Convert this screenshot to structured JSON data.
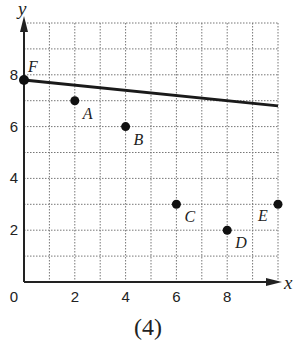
{
  "chart_data": {
    "type": "scatter",
    "title": "",
    "caption": "(4)",
    "xlabel": "x",
    "ylabel": "y",
    "xlim": [
      0,
      10
    ],
    "ylim": [
      0,
      10
    ],
    "grid": true,
    "grid_style": "dotted",
    "grid_step": 1,
    "x_ticks": [
      0,
      2,
      4,
      6,
      8
    ],
    "y_ticks": [
      2,
      4,
      6,
      8
    ],
    "origin_label": "0",
    "points": [
      {
        "label": "A",
        "x": 2,
        "y": 7
      },
      {
        "label": "B",
        "x": 4,
        "y": 6
      },
      {
        "label": "C",
        "x": 6,
        "y": 3
      },
      {
        "label": "D",
        "x": 8,
        "y": 2
      },
      {
        "label": "E",
        "x": 10,
        "y": 3
      },
      {
        "label": "F",
        "x": 0,
        "y": 7.8
      }
    ],
    "line": {
      "x1": 0,
      "y1": 7.8,
      "x2": 10,
      "y2": 6.8,
      "color": "#1a1a1a"
    },
    "point_color": "#111111"
  }
}
